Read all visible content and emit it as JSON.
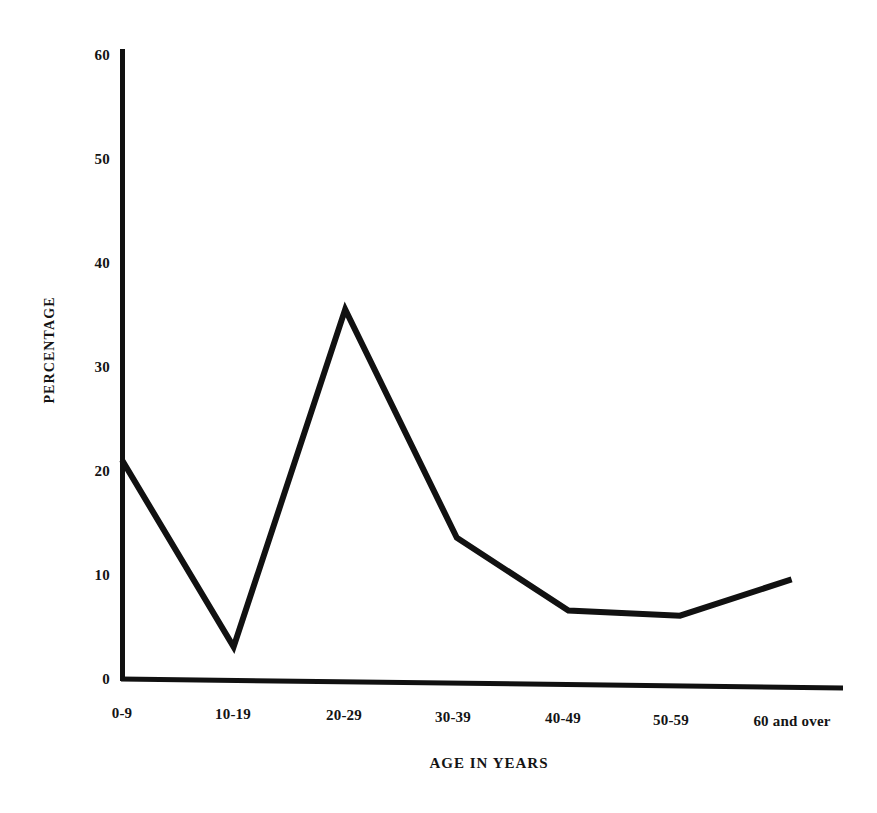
{
  "chart_data": {
    "type": "line",
    "title": "",
    "subtitle": "",
    "xlabel": "AGE IN YEARS",
    "ylabel": "PERCENTAGE",
    "categories": [
      "0-9",
      "10-19",
      "20-29",
      "30-39",
      "40-49",
      "50-59",
      "60 and over"
    ],
    "values": [
      21,
      3,
      35.5,
      13.5,
      6.5,
      6,
      9.5
    ],
    "series": [
      {
        "name": "Percentage",
        "values": [
          21,
          3,
          35.5,
          13.5,
          6.5,
          6,
          9.5
        ]
      }
    ],
    "ylim": [
      0,
      60
    ],
    "y_ticks": [
      0,
      10,
      20,
      30,
      40,
      50,
      60
    ],
    "y_tick_labels": [
      "0",
      "10",
      "20",
      "30",
      "40",
      "50",
      "60"
    ],
    "x_tick_labels": [
      "0-9",
      "10-19",
      "20-29",
      "30-39",
      "40-49",
      "50-59",
      "60 and over"
    ],
    "grid": false,
    "legend": false,
    "legend_position": "none",
    "line_color": "#111111",
    "background_color": "#ffffff",
    "axis_color": "#111111",
    "annotations": []
  },
  "axes": {
    "y_title": "PERCENTAGE",
    "x_title": "AGE IN YEARS",
    "y_tick_0": "0",
    "y_tick_10": "10",
    "y_tick_20": "20",
    "y_tick_30": "30",
    "y_tick_40": "40",
    "y_tick_50": "50",
    "y_tick_60": "60",
    "x_tick_0": "0-9",
    "x_tick_1": "10-19",
    "x_tick_2": "20-29",
    "x_tick_3": "30-39",
    "x_tick_4": "40-49",
    "x_tick_5": "50-59",
    "x_tick_6": "60 and over"
  }
}
